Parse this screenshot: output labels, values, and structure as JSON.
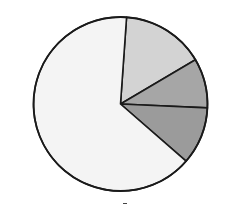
{
  "chart_data": {
    "type": "pie",
    "title": "",
    "start_angle_deg": 4,
    "direction": "clockwise",
    "slices": [
      {
        "label": "",
        "value": 15.4,
        "color": "#d3d3d3"
      },
      {
        "label": "",
        "value": 9.2,
        "color": "#a6a6a6"
      },
      {
        "label": "",
        "value": 10.7,
        "color": "#9b9b9b"
      },
      {
        "label": "",
        "value": 64.7,
        "color": "#f4f4f4"
      }
    ],
    "legend": "none",
    "stroke_color": "#1a1a1a"
  }
}
